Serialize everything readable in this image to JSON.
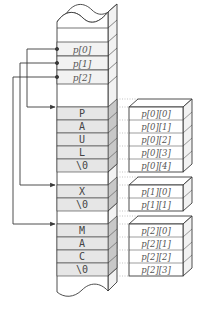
{
  "diagram": {
    "title": "",
    "colors": {
      "stroke": "#3a3a3a",
      "cell_fill_shaded": "#e6e6e6",
      "cell_fill_plain": "#ffffff",
      "side_fill_shaded": "#c8c8c8",
      "side_fill_plain": "#f2f2f2",
      "text": "#555555",
      "dotted": "#9a9a9a"
    },
    "pointer_array": {
      "label": "p",
      "cells": [
        "p[0]",
        "p[1]",
        "p[2]"
      ]
    },
    "strings": [
      {
        "chars": [
          "P",
          "A",
          "U",
          "L",
          "\\0"
        ],
        "elements": [
          "p[0][0]",
          "p[0][1]",
          "p[0][2]",
          "p[0][3]",
          "p[0][4]"
        ]
      },
      {
        "chars": [
          "X",
          "\\0"
        ],
        "elements": [
          "p[1][0]",
          "p[1][1]"
        ]
      },
      {
        "chars": [
          "M",
          "A",
          "C",
          "\\0"
        ],
        "elements": [
          "p[2][0]",
          "p[2][1]",
          "p[2][2]",
          "p[2][3]"
        ]
      }
    ]
  }
}
